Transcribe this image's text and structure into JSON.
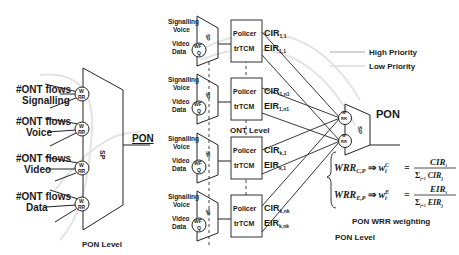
{
  "left": {
    "groups": [
      {
        "title": "#ONT flows",
        "name": "Signalling",
        "sched_top": "W",
        "sched_bot": "RR"
      },
      {
        "title": "#ONT flows",
        "name": "Voice",
        "sched_top": "W",
        "sched_bot": "RR"
      },
      {
        "title": "#ONT flows",
        "name": "Video",
        "sched_top": "W",
        "sched_bot": "RR"
      },
      {
        "title": "#ONT flows",
        "name": "Data",
        "sched_top": "W",
        "sched_bot": "RR"
      }
    ],
    "mux_label": "SP",
    "output_label": "PON",
    "level_label": "PON Level"
  },
  "middle": {
    "onts": [
      {
        "inputs": [
          "Signalling",
          "Voice",
          "Video",
          "Data"
        ],
        "wfq": "WF",
        "wfq2": "Q",
        "mux": "SP",
        "policer": "Policer",
        "trtcm": "trTCM",
        "cir": "CIR",
        "cir_sub": "1,1",
        "eir": "EIR",
        "eir_sub": "1,1"
      },
      {
        "inputs": [
          "Signalling",
          "Voice",
          "Video",
          "Data"
        ],
        "wfq": "WF",
        "wfq2": "Q",
        "mux": "SP",
        "policer": "Policer",
        "trtcm": "trTCM",
        "cir": "CIR",
        "cir_sub": "1,n1",
        "eir": "EIR",
        "eir_sub": "1,n1"
      },
      {
        "inputs": [
          "Signalling",
          "Voice",
          "Video",
          "Data"
        ],
        "wfq": "WF",
        "wfq2": "Q",
        "mux": "SP",
        "policer": "Policer",
        "trtcm": "trTCM",
        "cir": "CIR",
        "cir_sub": "k,1",
        "eir": "EIR",
        "eir_sub": "k,1"
      },
      {
        "inputs": [
          "Signalling",
          "Voice",
          "Video",
          "Data"
        ],
        "wfq": "WF",
        "wfq2": "Q",
        "mux": "SP",
        "policer": "Policer",
        "trtcm": "trTCM",
        "cir": "CIR",
        "cir_sub": "k,nk",
        "eir": "EIR",
        "eir_sub": "k,nk"
      }
    ],
    "level_label": "ONT Level"
  },
  "right": {
    "legend": [
      {
        "label": "High Priority",
        "color": "#cfcfcf"
      },
      {
        "label": "Low Priority",
        "color": "#e0e0e0"
      }
    ],
    "sched_labels": [
      "W",
      "RR",
      "W",
      "RR"
    ],
    "mux_label": "SP",
    "output_label": "PON",
    "formula_cp": {
      "lhs": "WRR",
      "lhs_sub": "C,P",
      "w": "w",
      "w_sup": "C",
      "w_sub": "i",
      "num": "CIR",
      "num_sub": "i",
      "den": "CIR",
      "den_sub": "j",
      "sum": "Σ",
      "sum_range": "j=1",
      "sum_top": "k"
    },
    "formula_ep": {
      "lhs": "WRR",
      "lhs_sub": "E,P",
      "w": "w",
      "w_sup": "E",
      "w_sub": "i",
      "num": "EIR",
      "num_sub": "i",
      "den": "EIR",
      "den_sub": "j",
      "sum": "Σ",
      "sum_range": "j=1",
      "sum_top": "k"
    },
    "arrow": "⇒",
    "eq": "=",
    "weighting_label": "PON WRR weighting",
    "level_label": "PON Level"
  }
}
